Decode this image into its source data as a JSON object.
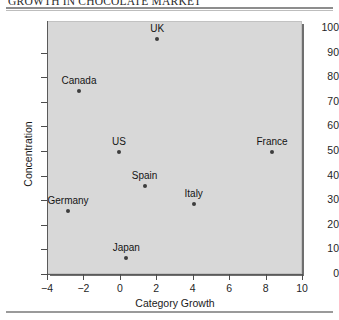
{
  "figure": {
    "title": "GROWTH IN CHOCOLATE MARKET"
  },
  "chart_data": {
    "type": "scatter",
    "title": "GROWTH IN CHOCOLATE MARKET",
    "xlabel": "Category Growth",
    "ylabel": "Concentration",
    "xlim": [
      -4,
      10
    ],
    "ylim": [
      0,
      100
    ],
    "grid": false,
    "legend": null,
    "xticks": [
      -4,
      -2,
      0,
      2,
      4,
      6,
      8,
      10
    ],
    "xticklabels": [
      "−4",
      "−2",
      "0",
      "2",
      "4",
      "6",
      "8",
      "10"
    ],
    "yticks": [
      0,
      10,
      20,
      30,
      40,
      50,
      60,
      70,
      80,
      90,
      100
    ],
    "yticklabels": [
      "0",
      "10",
      "20",
      "30",
      "40",
      "50",
      "60",
      "70",
      "80",
      "90",
      "100"
    ],
    "marker_color": "#3d3d3d",
    "panel_color": "#d8d8d8",
    "points": [
      {
        "label": "UK",
        "x": 2.0,
        "y": 96
      },
      {
        "label": "Canada",
        "x": -2.3,
        "y": 75
      },
      {
        "label": "US",
        "x": -0.1,
        "y": 50
      },
      {
        "label": "France",
        "x": 8.3,
        "y": 50
      },
      {
        "label": "Spain",
        "x": 1.3,
        "y": 36
      },
      {
        "label": "Italy",
        "x": 4.0,
        "y": 29
      },
      {
        "label": "Germany",
        "x": -2.9,
        "y": 26
      },
      {
        "label": "Japan",
        "x": 0.3,
        "y": 7
      }
    ]
  }
}
